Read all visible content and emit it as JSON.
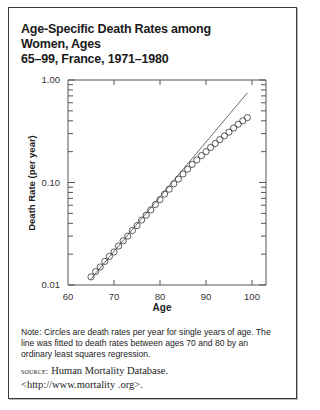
{
  "figure": {
    "title": "Age-Specific Death Rates among Women, Ages 65–99, France, 1971–1980",
    "title_line1": "Age-Specific Death Rates among Women, Ages",
    "title_line2": "65–99, France, 1971–1980",
    "note": "Note: Circles are death rates per year for single years of age. The line was fitted to death rates between ages 70 and 80 by an ordinary least squares regression.",
    "source_label": "source:",
    "source_text": "Human Mortality Database.",
    "source_url": "<http://www.mortality .org>."
  },
  "chart_data": {
    "type": "scatter",
    "title": "Age-Specific Death Rates among Women, Ages 65–99, France, 1971–1980",
    "xlabel": "Age",
    "ylabel": "Death Rate (per year)",
    "xlim": [
      60,
      104
    ],
    "ylim": [
      0.01,
      1.0
    ],
    "yscale": "log",
    "x_ticks": [
      60,
      70,
      80,
      90,
      100
    ],
    "y_ticks": [
      0.01,
      0.1,
      1.0
    ],
    "y_tick_labels": [
      "0.01",
      "0.10",
      "1.00"
    ],
    "grid": false,
    "legend": null,
    "series": [
      {
        "name": "Observed death rates",
        "marker": "open-circle",
        "x": [
          65,
          66,
          67,
          68,
          69,
          70,
          71,
          72,
          73,
          74,
          75,
          76,
          77,
          78,
          79,
          80,
          81,
          82,
          83,
          84,
          85,
          86,
          87,
          88,
          89,
          90,
          91,
          92,
          93,
          94,
          95,
          96,
          97,
          98,
          99
        ],
        "values": [
          0.012,
          0.0135,
          0.015,
          0.017,
          0.019,
          0.021,
          0.024,
          0.027,
          0.03,
          0.034,
          0.038,
          0.043,
          0.048,
          0.054,
          0.061,
          0.068,
          0.077,
          0.086,
          0.097,
          0.108,
          0.121,
          0.135,
          0.15,
          0.166,
          0.183,
          0.2,
          0.22,
          0.24,
          0.262,
          0.285,
          0.31,
          0.34,
          0.37,
          0.4,
          0.43
        ]
      },
      {
        "name": "OLS fit (ages 70–80)",
        "marker": "line",
        "x": [
          65,
          99
        ],
        "values": [
          0.0115,
          0.75
        ]
      }
    ]
  }
}
